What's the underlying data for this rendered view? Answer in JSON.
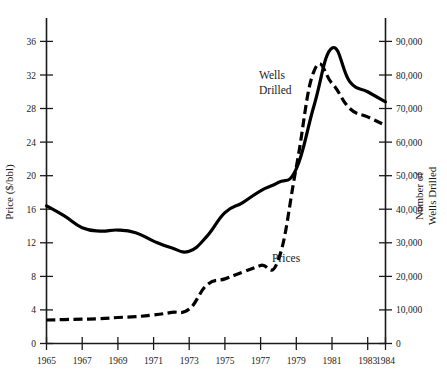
{
  "chart_data": {
    "type": "line",
    "title": "",
    "xlabel": "",
    "ylabel": "Price ($/bbl)",
    "y2label": "Number of Wells Drilled",
    "grid": false,
    "legend": "inline-annotations",
    "xlim": [
      1965,
      1984
    ],
    "ylim": [
      0,
      38
    ],
    "y2lim": [
      0,
      95000
    ],
    "x_ticks": [
      "1965",
      "1967",
      "1969",
      "1971",
      "1973",
      "1975",
      "1977",
      "1979",
      "1981",
      "1983",
      "1984"
    ],
    "x_tick_values": [
      1965,
      1967,
      1969,
      1971,
      1973,
      1975,
      1977,
      1979,
      1981,
      1983,
      1984
    ],
    "y_ticks": [
      "0",
      "4",
      "8",
      "12",
      "16",
      "20",
      "24",
      "28",
      "32",
      "36"
    ],
    "y_tick_values": [
      0,
      4,
      8,
      12,
      16,
      20,
      24,
      28,
      32,
      36
    ],
    "y2_ticks": [
      "0",
      "10,000",
      "20,000",
      "30,000",
      "40,000",
      "50,000",
      "60,000",
      "70,000",
      "80,000",
      "90,000"
    ],
    "y2_tick_values": [
      0,
      10000,
      20000,
      30000,
      40000,
      50000,
      60000,
      70000,
      80000,
      90000
    ],
    "series": [
      {
        "name": "Wells Drilled",
        "axis": "right",
        "style": "solid",
        "unit": "wells",
        "x": [
          1965,
          1966,
          1967,
          1968,
          1969,
          1970,
          1971,
          1972,
          1973,
          1974,
          1975,
          1976,
          1977,
          1978,
          1979,
          1980,
          1981,
          1982,
          1983,
          1984
        ],
        "values": [
          41000,
          38000,
          34500,
          33500,
          33800,
          33000,
          30500,
          28500,
          27500,
          32000,
          39000,
          42000,
          45500,
          48000,
          52000,
          71000,
          88000,
          78000,
          75000,
          72000
        ]
      },
      {
        "name": "Prices",
        "axis": "left",
        "style": "dashed",
        "unit": "$/bbl",
        "x": [
          1965,
          1966,
          1967,
          1968,
          1969,
          1970,
          1971,
          1972,
          1973,
          1974,
          1975,
          1976,
          1977,
          1978,
          1979,
          1980,
          1981,
          1982,
          1983,
          1984
        ],
        "values": [
          2.8,
          2.85,
          2.9,
          2.95,
          3.1,
          3.2,
          3.4,
          3.7,
          4.1,
          7.0,
          7.7,
          8.5,
          9.3,
          10.0,
          21.0,
          32.5,
          31.0,
          28.0,
          27.0,
          26.0
        ]
      }
    ],
    "annotations": [
      {
        "text_line1": "Wells",
        "text_line2": "Drilled",
        "name": "wells-drilled-label"
      },
      {
        "text": "Prices",
        "name": "prices-label"
      }
    ],
    "colors": {
      "line": "#000000",
      "axis": "#1a1a1a",
      "background": "#ffffff"
    }
  }
}
